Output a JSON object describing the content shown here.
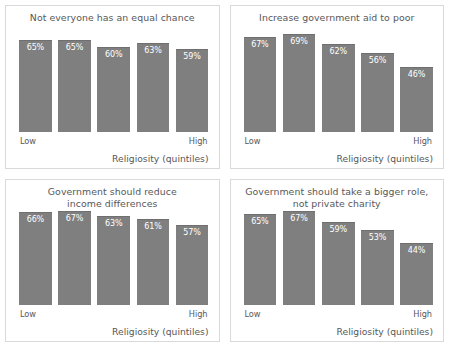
{
  "chart_data": [
    {
      "type": "bar",
      "title": "Not everyone has an equal chance",
      "xlabel": "Religiosity (quintiles)",
      "ylabel": "",
      "categories": [
        "Low",
        "2",
        "3",
        "4",
        "High"
      ],
      "tick_labels": {
        "first": "Low",
        "last": "High"
      },
      "values": [
        65,
        65,
        60,
        63,
        59
      ],
      "value_labels": [
        "65%",
        "65%",
        "60%",
        "63%",
        "59%"
      ],
      "ylim": [
        0,
        75
      ],
      "grid": false,
      "legend": "none",
      "bar_color": "#7f7f7f",
      "label_color": "#ffffff"
    },
    {
      "type": "bar",
      "title": "Increase government aid to poor",
      "xlabel": "Religiosity (quintiles)",
      "ylabel": "",
      "categories": [
        "Low",
        "2",
        "3",
        "4",
        "High"
      ],
      "tick_labels": {
        "first": "Low",
        "last": "High"
      },
      "values": [
        67,
        69,
        62,
        56,
        46
      ],
      "value_labels": [
        "67%",
        "69%",
        "62%",
        "56%",
        "46%"
      ],
      "ylim": [
        0,
        75
      ],
      "grid": false,
      "legend": "none",
      "bar_color": "#7f7f7f",
      "label_color": "#ffffff"
    },
    {
      "type": "bar",
      "title": "Government should reduce\nincome differences",
      "xlabel": "Religiosity (quintiles)",
      "ylabel": "",
      "categories": [
        "Low",
        "2",
        "3",
        "4",
        "High"
      ],
      "tick_labels": {
        "first": "Low",
        "last": "High"
      },
      "values": [
        66,
        67,
        63,
        61,
        57
      ],
      "value_labels": [
        "66%",
        "67%",
        "63%",
        "61%",
        "57%"
      ],
      "ylim": [
        0,
        75
      ],
      "grid": false,
      "legend": "none",
      "bar_color": "#7f7f7f",
      "label_color": "#ffffff"
    },
    {
      "type": "bar",
      "title": "Government should take a bigger role,\nnot private charity",
      "xlabel": "Religiosity (quintiles)",
      "ylabel": "",
      "categories": [
        "Low",
        "2",
        "3",
        "4",
        "High"
      ],
      "tick_labels": {
        "first": "Low",
        "last": "High"
      },
      "values": [
        65,
        67,
        59,
        53,
        44
      ],
      "value_labels": [
        "65%",
        "67%",
        "59%",
        "53%",
        "44%"
      ],
      "ylim": [
        0,
        75
      ],
      "grid": false,
      "legend": "none",
      "bar_color": "#7f7f7f",
      "label_color": "#ffffff"
    }
  ]
}
